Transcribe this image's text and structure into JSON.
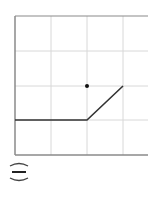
{
  "graph": {
    "grid": {
      "x_lines": [
        15,
        51,
        87,
        123
      ],
      "y_lines": [
        16,
        51,
        86,
        120,
        155
      ],
      "grid_color": "#d8d8d8",
      "axis_color": "#8a8a8a"
    },
    "polyline": {
      "points": [
        [
          15,
          120
        ],
        [
          87,
          120
        ],
        [
          123,
          86
        ]
      ],
      "color": "#333333"
    },
    "dot": {
      "x": 87,
      "y": 86,
      "color": "#111111"
    }
  },
  "choice_label": {
    "symbol": "(=)"
  }
}
